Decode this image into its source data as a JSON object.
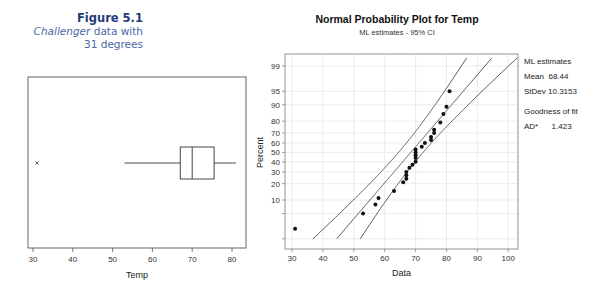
{
  "caption": {
    "figure": "Figure 5.1",
    "line1_italic": "Challenger",
    "line1_rest": " data with",
    "line2": "31 degrees"
  },
  "chart_data": [
    {
      "type": "box",
      "title": "",
      "xlabel": "Temp",
      "xticks": [
        30,
        40,
        50,
        60,
        70,
        80
      ],
      "xlim": [
        28.7,
        83.5
      ],
      "box": {
        "whisker_low": 53,
        "q1": 67,
        "median": 70,
        "q3": 75.5,
        "whisker_high": 81
      },
      "outliers": [
        31
      ],
      "outlier_marker": "x"
    },
    {
      "type": "scatter",
      "title": "Normal Probability Plot for Temp",
      "subtitle": "ML estimates - 95% CI",
      "xlabel": "Data",
      "ylabel": "Percent",
      "xticks": [
        30,
        40,
        50,
        60,
        70,
        80,
        90,
        100
      ],
      "yticks": [
        99,
        95,
        90,
        80,
        70,
        60,
        50,
        40,
        30,
        20,
        10
      ],
      "y_scale": "normal probability",
      "grid": true,
      "points": [
        {
          "x": 31,
          "p": 2
        },
        {
          "x": 53,
          "p": 5
        },
        {
          "x": 57,
          "p": 8
        },
        {
          "x": 58,
          "p": 11
        },
        {
          "x": 63,
          "p": 15
        },
        {
          "x": 66,
          "p": 21
        },
        {
          "x": 67,
          "p": 24
        },
        {
          "x": 67,
          "p": 27
        },
        {
          "x": 67,
          "p": 30
        },
        {
          "x": 68,
          "p": 34
        },
        {
          "x": 69,
          "p": 37
        },
        {
          "x": 70,
          "p": 40
        },
        {
          "x": 70,
          "p": 44
        },
        {
          "x": 70,
          "p": 47
        },
        {
          "x": 70,
          "p": 50
        },
        {
          "x": 70,
          "p": 53
        },
        {
          "x": 72,
          "p": 56
        },
        {
          "x": 73,
          "p": 60
        },
        {
          "x": 75,
          "p": 63
        },
        {
          "x": 75,
          "p": 66
        },
        {
          "x": 76,
          "p": 70
        },
        {
          "x": 76,
          "p": 73
        },
        {
          "x": 78,
          "p": 79
        },
        {
          "x": 79,
          "p": 85
        },
        {
          "x": 80,
          "p": 89
        },
        {
          "x": 81,
          "p": 95
        }
      ],
      "fit": {
        "mean": 68.44,
        "stdev": 10.3153
      },
      "stats_panel": {
        "heading": "ML estimates",
        "mean_label": "Mean",
        "mean_value": "68.44",
        "stdev_label": "StDev",
        "stdev_value": "10.3153",
        "gof_heading": "Goodness of fit",
        "ad_label": "AD*",
        "ad_value": "1.423"
      }
    }
  ]
}
